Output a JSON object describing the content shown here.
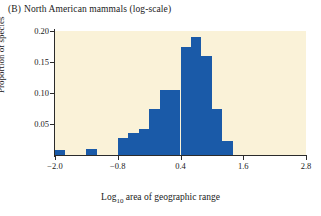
{
  "title": {
    "panel": "(B)",
    "text": "North American mammals (log-scale)"
  },
  "axis_captions": {
    "y": "Proportion of species",
    "x_prefix": "Log",
    "x_sub": "10",
    "x_suffix": " area of geographic range"
  },
  "colors": {
    "bar": "#1a5aa8",
    "plot_background": "#faf2d8",
    "axis": "#2b2b2b",
    "page_background": "#ffffff"
  },
  "chart_data": {
    "type": "bar",
    "xlabel": "Log10 area of geographic range",
    "ylabel": "Proportion of species",
    "xlim": [
      -2.0,
      2.8
    ],
    "ylim": [
      0.0,
      0.2
    ],
    "xticks": [
      -2.0,
      -0.8,
      0.4,
      1.6,
      2.8
    ],
    "xtick_labels": [
      "−2.0",
      "−0.8",
      "0.4",
      "1.6",
      "2.8"
    ],
    "yticks": [
      0.05,
      0.1,
      0.15,
      0.2
    ],
    "ytick_labels": [
      "0.05",
      "0.10",
      "0.15",
      "0.20"
    ],
    "grid": false,
    "legend": null,
    "bin_width": 0.2,
    "bin_starts": [
      -2.0,
      -1.8,
      -1.6,
      -1.4,
      -1.2,
      -1.0,
      -0.8,
      -0.6,
      -0.4,
      -0.2,
      0.0,
      0.2,
      0.4,
      0.6,
      0.8,
      1.0,
      1.2
    ],
    "values": [
      0.008,
      0.0,
      0.0,
      0.009,
      0.0,
      0.0,
      0.028,
      0.035,
      0.042,
      0.075,
      0.105,
      0.105,
      0.175,
      0.19,
      0.16,
      0.075,
      0.022
    ]
  }
}
